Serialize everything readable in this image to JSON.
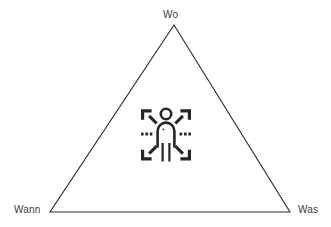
{
  "canvas": {
    "width": 331,
    "height": 227,
    "background_color": "#ffffff"
  },
  "diagram": {
    "type": "triangle-model",
    "shape_name": "triangle",
    "stroke_color": "#2b2b2b",
    "stroke_width": 1,
    "fill": "none",
    "vertices": [
      {
        "id": "top",
        "x": 174,
        "y": 25
      },
      {
        "id": "bottom-left",
        "x": 50,
        "y": 212
      },
      {
        "id": "bottom-right",
        "x": 290,
        "y": 212
      }
    ],
    "labels": [
      {
        "id": "top",
        "text": "Wo",
        "position": "above-apex"
      },
      {
        "id": "bottom-left",
        "text": "Wann",
        "position": "left-of-vertex"
      },
      {
        "id": "bottom-right",
        "text": "Was",
        "position": "right-of-vertex"
      }
    ],
    "label_color": "#3b3b3b",
    "label_font_size": 10
  },
  "center_icon": {
    "name": "person-with-radiating-arrows-icon",
    "color": "#23272b",
    "description": "outlined standing person with four diagonal arrows radiating outward and dotted lines at left and right",
    "bounds": {
      "x": 140,
      "y": 107,
      "width": 52,
      "height": 56
    }
  }
}
